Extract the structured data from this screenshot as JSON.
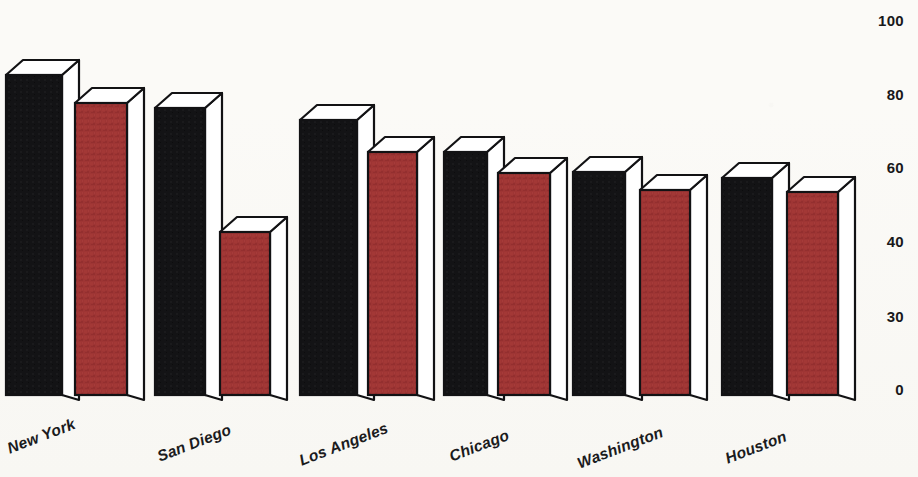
{
  "chart_data": {
    "type": "bar",
    "title": "",
    "subtitle": "",
    "xlabel": "",
    "ylabel": "",
    "categories": [
      "New York",
      "San Diego",
      "Los Angeles",
      "Chicago",
      "Washington",
      "Houston"
    ],
    "series": [
      {
        "name": "Series 1",
        "color": "#131315",
        "values": [
          95,
          77,
          73,
          64,
          59,
          57
        ]
      },
      {
        "name": "Series 2",
        "color": "#9e3534",
        "values": [
          88,
          42,
          64,
          58,
          54,
          53
        ]
      }
    ],
    "y_tick_labels": [
      "100",
      "80",
      "60",
      "40",
      "30",
      "0"
    ],
    "y_tick_values": [
      100,
      80,
      60,
      40,
      30,
      0
    ],
    "y_tick_pixel_y": [
      21,
      95,
      168,
      242,
      317,
      390
    ],
    "ylim": [
      0,
      100
    ],
    "grid": false,
    "legend": "none",
    "style": "3d-block-bars",
    "tick_label_position": "right",
    "category_label_rotation_deg": -21,
    "baseline_pixel_y": 395,
    "bar_geometry": [
      {
        "x": 6,
        "w": 56,
        "top": 75,
        "series": 0
      },
      {
        "x": 75,
        "w": 52,
        "top": 103,
        "series": 1
      },
      {
        "x": 155,
        "w": 50,
        "top": 108,
        "series": 0
      },
      {
        "x": 220,
        "w": 50,
        "top": 232,
        "series": 1
      },
      {
        "x": 300,
        "w": 57,
        "top": 120,
        "series": 0
      },
      {
        "x": 368,
        "w": 49,
        "top": 152,
        "series": 1
      },
      {
        "x": 444,
        "w": 43,
        "top": 152,
        "series": 0
      },
      {
        "x": 498,
        "w": 52,
        "top": 173,
        "series": 1
      },
      {
        "x": 573,
        "w": 52,
        "top": 172,
        "series": 0
      },
      {
        "x": 640,
        "w": 50,
        "top": 190,
        "series": 1
      },
      {
        "x": 722,
        "w": 50,
        "top": 178,
        "series": 0
      },
      {
        "x": 787,
        "w": 51,
        "top": 192,
        "series": 1
      }
    ],
    "category_label_anchors": [
      {
        "label": "New York",
        "x": 8,
        "y": 440
      },
      {
        "label": "San Diego",
        "x": 158,
        "y": 448
      },
      {
        "label": "Los Angeles",
        "x": 300,
        "y": 452
      },
      {
        "label": "Chicago",
        "x": 450,
        "y": 448
      },
      {
        "label": "Washington",
        "x": 578,
        "y": 455
      },
      {
        "label": "Houston",
        "x": 726,
        "y": 450
      }
    ],
    "colors": {
      "series1_fill": "#131315",
      "series2_fill": "#9e3534",
      "bar_top_face": "#ffffff",
      "bar_side_face": "#ffffff",
      "outline": "#121214",
      "background": "#fbfaf7",
      "text": "#18181a"
    }
  }
}
